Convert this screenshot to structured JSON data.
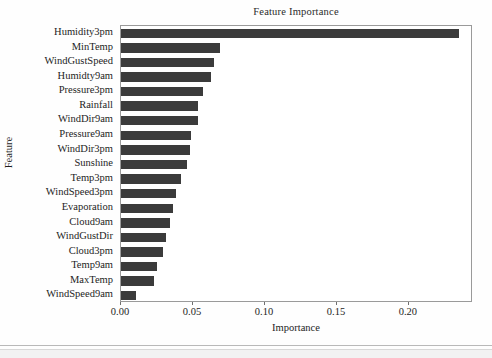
{
  "chart_data": {
    "type": "bar",
    "orientation": "horizontal",
    "title": "Feature Importance",
    "xlabel": "Importance",
    "ylabel": "Feature",
    "xlim": [
      0.0,
      0.2445
    ],
    "grid": false,
    "legend": null,
    "xticks": [
      "0.00",
      "0.05",
      "0.10",
      "0.15",
      "0.20"
    ],
    "xtick_values": [
      0.0,
      0.05,
      0.1,
      0.15,
      0.2
    ],
    "bar_color": "#3b3b3b",
    "categories": [
      "Humidity3pm",
      "MinTemp",
      "WindGustSpeed",
      "Humidty9am",
      "Pressure3pm",
      "Rainfall",
      "WindDir9am",
      "Pressure9am",
      "WindDir3pm",
      "Sunshine",
      "Temp3pm",
      "WindSpeed3pm",
      "Evaporation",
      "Cloud9am",
      "WindGustDir",
      "Cloud3pm",
      "Temp9am",
      "MaxTemp",
      "WindSpeed9am"
    ],
    "values": [
      0.2345,
      0.0687,
      0.0646,
      0.0625,
      0.0569,
      0.0535,
      0.0532,
      0.0486,
      0.0478,
      0.0458,
      0.0417,
      0.0382,
      0.0361,
      0.034,
      0.0313,
      0.0292,
      0.025,
      0.0229,
      0.0105
    ]
  }
}
